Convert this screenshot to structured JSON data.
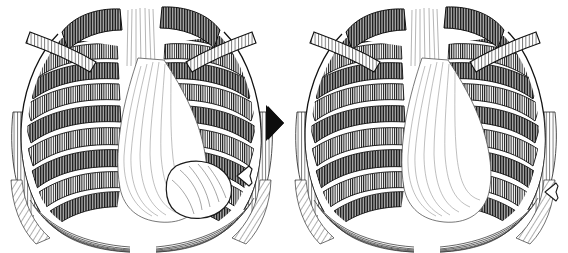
{
  "figure": {
    "type": "medical-illustration",
    "style": "pen-and-ink engraving / cross-hatched line art",
    "background_color": "#ffffff",
    "ink_color": "#111111",
    "width": 568,
    "height": 253,
    "panel_count": 2,
    "caption": ""
  },
  "panels": [
    {
      "id": "panel-left",
      "name": "before-panel",
      "label": "",
      "order": 1,
      "finding": "focal rounded opacity in the right lower lung zone",
      "marker": {
        "name": "hollow-arrow-marker",
        "shape": "open outline arrowhead",
        "direction": "left",
        "x": 236,
        "y": 166,
        "width": 18,
        "height": 20,
        "fill": "#ffffff",
        "stroke": "#111111"
      }
    },
    {
      "id": "panel-right",
      "name": "after-panel",
      "label": "",
      "order": 2,
      "finding": "clear lung zone, opacity resolved",
      "marker": {
        "name": "hollow-arrow-marker",
        "shape": "open outline arrowhead",
        "direction": "left",
        "x": 544,
        "y": 182,
        "width": 16,
        "height": 18,
        "fill": "#ffffff",
        "stroke": "#111111"
      }
    }
  ],
  "transition": {
    "name": "transition-arrow",
    "shape": "solid filled arrowhead",
    "direction": "right",
    "color": "#0d0d0d",
    "x": 266,
    "y": 110,
    "width": 18,
    "height": 28
  },
  "anatomy": {
    "structures": [
      "clavicle-left",
      "clavicle-right",
      "rib-cage",
      "sternum",
      "mediastinum",
      "cardiac-silhouette",
      "diaphragm-left",
      "diaphragm-right",
      "costophrenic-angle-left",
      "costophrenic-angle-right",
      "lung-field-left",
      "lung-field-right"
    ],
    "rib_pairs": 9
  }
}
